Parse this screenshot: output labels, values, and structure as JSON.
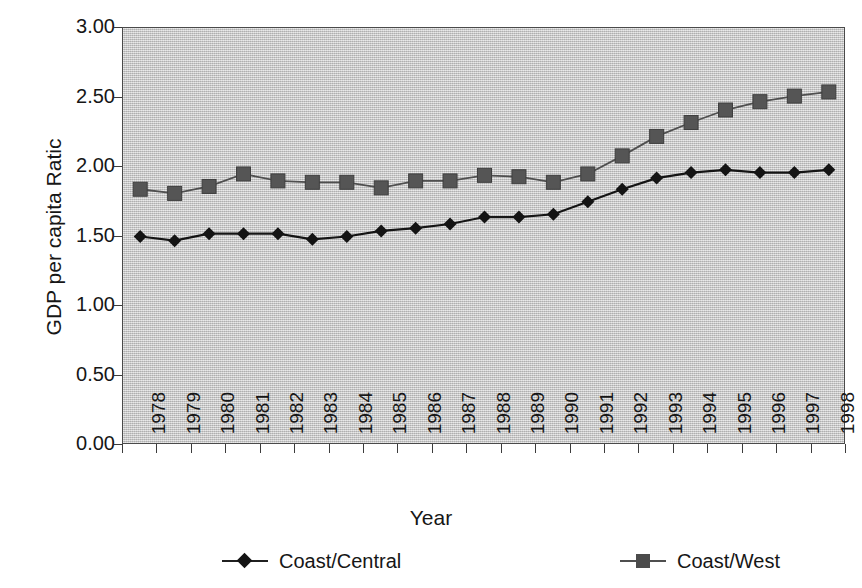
{
  "chart_data": {
    "type": "line",
    "title": "",
    "xlabel": "Year",
    "ylabel": "GDP per capita Ratic",
    "ylabel_text": "GDP per capita Ratic",
    "categories": [
      "1978",
      "1979",
      "1980",
      "1981",
      "1982",
      "1983",
      "1984",
      "1985",
      "1986",
      "1987",
      "1988",
      "1989",
      "1990",
      "1991",
      "1992",
      "1993",
      "1994",
      "1995",
      "1996",
      "1997",
      "1998"
    ],
    "x": [
      1978,
      1979,
      1980,
      1981,
      1982,
      1983,
      1984,
      1985,
      1986,
      1987,
      1988,
      1989,
      1990,
      1991,
      1992,
      1993,
      1994,
      1995,
      1996,
      1997,
      1998
    ],
    "ylim": [
      0.0,
      3.0
    ],
    "ytick_labels": [
      "3.00",
      "2.50",
      "2.00",
      "1.50",
      "1.00",
      "0.50",
      "0.00"
    ],
    "ytick_values": [
      3.0,
      2.5,
      2.0,
      1.5,
      1.0,
      0.5,
      0.0
    ],
    "grid": false,
    "legend_position": "bottom",
    "plot_background": "#c9c9c9",
    "series": [
      {
        "name": "Coast/Central",
        "marker": "diamond",
        "color": "#141414",
        "values": [
          1.5,
          1.47,
          1.52,
          1.52,
          1.52,
          1.48,
          1.5,
          1.54,
          1.56,
          1.59,
          1.64,
          1.64,
          1.66,
          1.75,
          1.84,
          1.92,
          1.96,
          1.98,
          1.96,
          1.96,
          1.98
        ]
      },
      {
        "name": "Coast/West",
        "marker": "square",
        "color": "#4b4b4b",
        "values": [
          1.84,
          1.81,
          1.86,
          1.95,
          1.9,
          1.89,
          1.89,
          1.85,
          1.9,
          1.9,
          1.94,
          1.93,
          1.89,
          1.95,
          2.08,
          2.22,
          2.32,
          2.41,
          2.47,
          2.51,
          2.54
        ]
      }
    ]
  },
  "legend": {
    "entries": [
      {
        "label": "Coast/Central",
        "marker": "diamond"
      },
      {
        "label": "Coast/West",
        "marker": "square"
      }
    ]
  },
  "axes": {
    "x_title": "Year",
    "y_title": "GDP per capita Ratic"
  }
}
